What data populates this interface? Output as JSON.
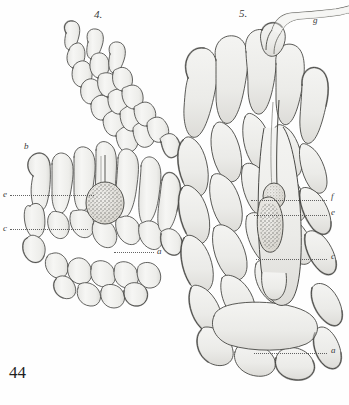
{
  "plate": {
    "number": "44",
    "figure_labels": [
      {
        "id": "fig4",
        "text": "4.",
        "x": 94,
        "y": 9,
        "kind": "figure-number"
      },
      {
        "id": "fig5",
        "text": "5.",
        "x": 239,
        "y": 8,
        "kind": "figure-number"
      }
    ],
    "key_labels": [
      {
        "id": "g",
        "text": "g",
        "x": 313,
        "y": 16,
        "figure": "5",
        "leader": null
      },
      {
        "id": "b",
        "text": "b",
        "x": 24,
        "y": 142,
        "figure": "4",
        "leader": null
      },
      {
        "id": "e4",
        "text": "e",
        "x": 3,
        "y": 190,
        "figure": "4",
        "leader": {
          "x": 10,
          "y": 195,
          "w": 84
        }
      },
      {
        "id": "c4",
        "text": "c",
        "x": 3,
        "y": 224,
        "figure": "4",
        "leader": {
          "x": 10,
          "y": 229,
          "w": 78
        }
      },
      {
        "id": "a4",
        "text": "a",
        "x": 157,
        "y": 247,
        "figure": "4",
        "leader": {
          "x": 114,
          "y": 252,
          "w": 40
        }
      },
      {
        "id": "f5",
        "text": "f",
        "x": 331,
        "y": 192,
        "figure": "5",
        "leader": {
          "x": 251,
          "y": 200,
          "w": 76
        }
      },
      {
        "id": "e5",
        "text": "e",
        "x": 331,
        "y": 208,
        "figure": "5",
        "leader": {
          "x": 254,
          "y": 215,
          "w": 73
        }
      },
      {
        "id": "c5",
        "text": "c",
        "x": 331,
        "y": 252,
        "figure": "5",
        "leader": {
          "x": 256,
          "y": 259,
          "w": 71
        }
      },
      {
        "id": "a5",
        "text": "a",
        "x": 331,
        "y": 346,
        "figure": "5",
        "leader": {
          "x": 254,
          "y": 353,
          "w": 73
        }
      }
    ],
    "figures": [
      {
        "id": "4",
        "name": "archegonium-longitudinal-section-small",
        "description": "Smaller ovoid multicellular body with a curved arm of elongate cells extending up and to the right; a granular stippled egg cell lies in the central axial canal.",
        "label_keys": [
          "b",
          "e",
          "c",
          "a"
        ]
      },
      {
        "id": "5",
        "name": "archegonium-longitudinal-section-large",
        "description": "Large elongate ovoid multicellular body with concentric tiers of elongate jacket cells; a central oblong stippled egg cell sits inside an axial canal; a slender neck tube curves out of the apex to the upper right.",
        "label_keys": [
          "g",
          "f",
          "e",
          "c",
          "a"
        ]
      }
    ],
    "render": {
      "ink": "#3b3b3b",
      "ink_light": "#9a9a9a",
      "fill": "#f2f2f0",
      "fill_shade": "#e3e3e0",
      "stipple": "#6a6a6a",
      "paper": "#fefefe"
    }
  }
}
